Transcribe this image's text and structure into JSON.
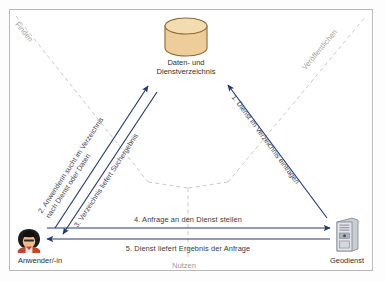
{
  "diagram": {
    "title_hidden": "",
    "colors": {
      "arrow": "#24386b",
      "dashed": "#bdbdbd",
      "cylinder_fill": "#eecd9a",
      "cylinder_stroke": "#8a6a33",
      "frame": "#b9b9b9",
      "label_text": "#3a3a3a",
      "faint_text": "#9a9a9a"
    },
    "nodes": [
      {
        "id": "registry",
        "icon": "database-cylinder-icon",
        "label_line1": "Daten- und",
        "label_line2": "Dienstverzeichnis"
      },
      {
        "id": "user",
        "icon": "user-person-icon",
        "label_line1": "Anwender/-in",
        "label_line2": ""
      },
      {
        "id": "service",
        "icon": "server-tower-icon",
        "label_line1": "Geodienst",
        "label_line2": ""
      }
    ],
    "dashed_labels": [
      {
        "id": "finden",
        "text": "Finden"
      },
      {
        "id": "veroeffentlichen",
        "text": "Veröffentlichen"
      },
      {
        "id": "nutzen",
        "text": "Nutzen"
      }
    ],
    "flows": [
      {
        "number": "1.",
        "id": "flow-register-service",
        "text": "1. Dienst im Verzeichnis eintragen",
        "line1": "1. Dienst im Verzeichnis eintragen",
        "line2": ""
      },
      {
        "number": "2.",
        "id": "flow-user-search",
        "text": "2. Anwenderin sucht im Verzeichnis nach Dienst oder Daten",
        "line1": "2. Anwenderin sucht im Verzeichnis",
        "line2": "nach Dienst oder Daten"
      },
      {
        "number": "3.",
        "id": "flow-search-result",
        "text": "3. Verzeichnis liefert Suchergebnis",
        "line1": "3. Verzeichnis liefert Suchergebnis",
        "line2": ""
      },
      {
        "number": "4.",
        "id": "flow-request-service",
        "text": "4. Anfrage an den Dienst stellen",
        "line1": "4. Anfrage an den Dienst stellen",
        "line2": ""
      },
      {
        "number": "5.",
        "id": "flow-service-response",
        "text": "5. Dienst liefert Ergebnis der Anfrage",
        "line1": "5. Dienst liefert Ergebnis der Anfrage",
        "line2": ""
      }
    ]
  }
}
